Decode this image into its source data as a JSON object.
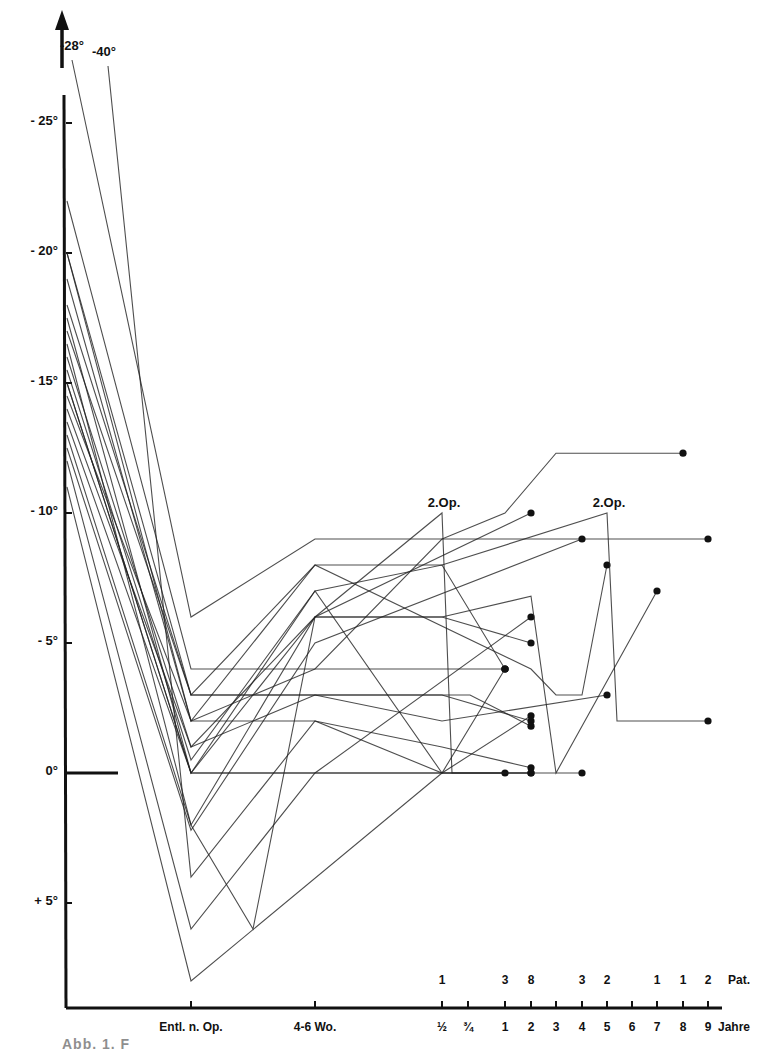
{
  "chart_data": {
    "type": "line",
    "title": "",
    "xlabel": "Jahre",
    "ylabel": "Winkel (°)",
    "y_axis": {
      "ticks": [
        {
          "label": "- 25°",
          "value": 25
        },
        {
          "label": "- 20°",
          "value": 20
        },
        {
          "label": "- 15°",
          "value": 15
        },
        {
          "label": "- 10°",
          "value": 10
        },
        {
          "label": "- 5°",
          "value": 5
        },
        {
          "label": "0°",
          "value": 0
        },
        {
          "label": "+ 5°",
          "value": -5
        }
      ],
      "ylim": [
        -9,
        29
      ],
      "offscale_labels": [
        {
          "label": "-28°",
          "x": 72,
          "y": 50
        },
        {
          "label": "-40°",
          "x": 104,
          "y": 56
        }
      ]
    },
    "x_axis": {
      "positions": [
        {
          "key": "start",
          "label": "",
          "px": 67
        },
        {
          "key": "entl",
          "label": "Entl. n. Op.",
          "px": 191
        },
        {
          "key": "wo",
          "label": "4-6 Wo.",
          "px": 315
        },
        {
          "key": "h",
          "label": "½",
          "px": 442
        },
        {
          "key": "q",
          "label": "¾",
          "px": 468
        },
        {
          "key": "y1",
          "label": "1",
          "px": 505
        },
        {
          "key": "y2",
          "label": "2",
          "px": 531
        },
        {
          "key": "y3",
          "label": "3",
          "px": 556
        },
        {
          "key": "y4",
          "label": "4",
          "px": 582
        },
        {
          "key": "y5",
          "label": "5",
          "px": 607
        },
        {
          "key": "y6",
          "label": "6",
          "px": 632
        },
        {
          "key": "y7",
          "label": "7",
          "px": 657
        },
        {
          "key": "y8",
          "label": "8",
          "px": 683
        },
        {
          "key": "y9",
          "label": "9",
          "px": 708
        }
      ],
      "unit_label": "Jahre"
    },
    "patient_counts": {
      "label": "Pat.",
      "counts": [
        {
          "at": "½",
          "n": 1
        },
        {
          "at": "1",
          "n": 3
        },
        {
          "at": "2",
          "n": 8
        },
        {
          "at": "4",
          "n": 3
        },
        {
          "at": "5",
          "n": 2
        },
        {
          "at": "7",
          "n": 1
        },
        {
          "at": "8",
          "n": 1
        },
        {
          "at": "9",
          "n": 2
        }
      ]
    },
    "annotations": [
      {
        "text": "2.Op.",
        "x": 442,
        "value": 10
      },
      {
        "text": "2.Op.",
        "x": 607,
        "value": 10
      }
    ],
    "series": [
      {
        "name": "P1",
        "points": [
          [
            67,
            28
          ],
          [
            191,
            6
          ],
          [
            315,
            9
          ],
          [
            442,
            9
          ],
          [
            505,
            10
          ],
          [
            556,
            12.3
          ],
          [
            683,
            12.3
          ]
        ],
        "end_dot": true
      },
      {
        "name": "P2",
        "points": [
          [
            67,
            40
          ],
          [
            191,
            -4
          ],
          [
            315,
            2
          ],
          [
            442,
            0
          ],
          [
            505,
            4
          ]
        ],
        "end_dot": true
      },
      {
        "name": "P3",
        "points": [
          [
            67,
            22
          ],
          [
            191,
            4
          ],
          [
            315,
            4
          ],
          [
            442,
            9
          ],
          [
            708,
            9
          ]
        ],
        "end_dot": true
      },
      {
        "name": "P4",
        "points": [
          [
            67,
            20
          ],
          [
            191,
            3
          ],
          [
            315,
            8
          ],
          [
            531,
            4
          ],
          [
            556,
            3
          ],
          [
            582,
            3
          ],
          [
            607,
            8
          ]
        ],
        "end_dot": true
      },
      {
        "name": "P5",
        "points": [
          [
            67,
            20
          ],
          [
            191,
            2
          ],
          [
            315,
            8
          ],
          [
            442,
            8
          ],
          [
            607,
            10
          ],
          [
            617,
            2
          ],
          [
            708,
            2
          ]
        ],
        "end_dot": true
      },
      {
        "name": "P6",
        "points": [
          [
            67,
            17.5
          ],
          [
            191,
            0
          ],
          [
            315,
            6
          ],
          [
            442,
            6
          ],
          [
            531,
            5
          ]
        ],
        "end_dot": true
      },
      {
        "name": "P7",
        "points": [
          [
            67,
            17
          ],
          [
            191,
            3
          ],
          [
            315,
            3
          ],
          [
            442,
            3
          ],
          [
            531,
            2
          ]
        ],
        "end_dot": true
      },
      {
        "name": "P8",
        "points": [
          [
            67,
            16
          ],
          [
            191,
            1
          ],
          [
            315,
            6
          ],
          [
            442,
            10
          ],
          [
            452,
            0
          ],
          [
            531,
            0
          ]
        ],
        "end_dot": true
      },
      {
        "name": "P9",
        "points": [
          [
            67,
            15
          ],
          [
            191,
            0
          ],
          [
            315,
            0
          ],
          [
            442,
            0
          ],
          [
            582,
            0
          ]
        ],
        "end_dot": true
      },
      {
        "name": "P10",
        "points": [
          [
            67,
            15
          ],
          [
            191,
            0
          ],
          [
            315,
            7
          ],
          [
            442,
            0
          ],
          [
            505,
            0
          ]
        ],
        "end_dot": true
      },
      {
        "name": "P11",
        "points": [
          [
            67,
            14.5
          ],
          [
            191,
            2
          ],
          [
            315,
            2
          ],
          [
            442,
            1
          ],
          [
            531,
            0.2
          ]
        ],
        "end_dot": true
      },
      {
        "name": "P12",
        "points": [
          [
            67,
            14
          ],
          [
            191,
            1
          ],
          [
            315,
            3
          ],
          [
            442,
            3
          ],
          [
            470,
            3
          ],
          [
            531,
            1.8
          ]
        ],
        "end_dot": true
      },
      {
        "name": "P13",
        "points": [
          [
            67,
            13.5
          ],
          [
            191,
            0
          ],
          [
            315,
            0
          ],
          [
            442,
            0
          ],
          [
            531,
            0
          ]
        ],
        "end_dot": true
      },
      {
        "name": "P14",
        "points": [
          [
            67,
            13
          ],
          [
            191,
            -2
          ],
          [
            315,
            6
          ],
          [
            531,
            10
          ]
        ],
        "end_dot": true
      },
      {
        "name": "P15",
        "points": [
          [
            67,
            12.5
          ],
          [
            191,
            -2.2
          ],
          [
            315,
            5
          ],
          [
            582,
            9
          ]
        ],
        "end_dot": true
      },
      {
        "name": "P16",
        "points": [
          [
            67,
            12
          ],
          [
            191,
            -6
          ],
          [
            315,
            0
          ],
          [
            531,
            6
          ]
        ],
        "end_dot": true
      },
      {
        "name": "P17",
        "points": [
          [
            67,
            11
          ],
          [
            191,
            -8
          ],
          [
            442,
            0
          ],
          [
            531,
            2.2
          ]
        ],
        "end_dot": true
      },
      {
        "name": "P18",
        "points": [
          [
            67,
            16.5
          ],
          [
            191,
            -2
          ],
          [
            253,
            -6
          ],
          [
            315,
            6
          ],
          [
            442,
            6
          ],
          [
            531,
            6.8
          ],
          [
            556,
            0
          ],
          [
            657,
            7
          ]
        ],
        "end_dot": true
      },
      {
        "name": "P19",
        "points": [
          [
            67,
            18
          ],
          [
            191,
            3
          ],
          [
            315,
            3
          ],
          [
            442,
            2
          ],
          [
            607,
            3
          ]
        ],
        "end_dot": true
      },
      {
        "name": "P20",
        "points": [
          [
            67,
            19
          ],
          [
            191,
            2
          ],
          [
            315,
            4
          ],
          [
            442,
            4
          ],
          [
            505,
            4
          ]
        ],
        "end_dot": true
      },
      {
        "name": "P21",
        "points": [
          [
            67,
            15.5
          ],
          [
            191,
            0.5
          ],
          [
            315,
            7
          ],
          [
            442,
            8
          ],
          [
            505,
            4
          ]
        ],
        "end_dot": true
      }
    ]
  },
  "caption": "Abb. 1. F"
}
